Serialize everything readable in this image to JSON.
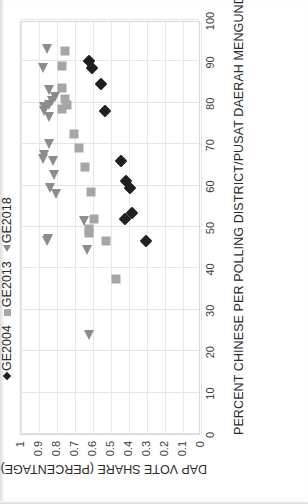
{
  "chart_data": {
    "type": "scatter",
    "title": "",
    "xlabel": "PERCENT CHINESE PER POLLING DISTRICT/PUSAT DAERAH MENGUNDI",
    "ylabel": "DAP VOTE SHARE (PERCENTAGE)",
    "xlim": [
      0,
      100
    ],
    "ylim": [
      0,
      1
    ],
    "xticks": [
      0,
      10,
      20,
      30,
      40,
      50,
      60,
      70,
      80,
      90,
      100
    ],
    "xtick_labels": [
      "0",
      "10",
      "20",
      "30",
      "40",
      "50",
      "60",
      "70",
      "80",
      "90",
      "100"
    ],
    "yticks": [
      0,
      0.1,
      0.2,
      0.3,
      0.4,
      0.5,
      0.6,
      0.7,
      0.8,
      0.9,
      1
    ],
    "ytick_labels": [
      "0",
      "0.1",
      "0.2",
      "0.3",
      "0.4",
      "0.5",
      "0.6",
      "0.7",
      "0.8",
      "0.9",
      "1"
    ],
    "grid": true,
    "legend_position": "top-left",
    "rotation_degrees": -90,
    "series": [
      {
        "name": "GE2004",
        "marker": "diamond",
        "color": "#1f1f1f",
        "points": [
          [
            90.0,
            0.625
          ],
          [
            88.5,
            0.605
          ],
          [
            84.5,
            0.555
          ],
          [
            78.0,
            0.535
          ],
          [
            66.0,
            0.445
          ],
          [
            61.0,
            0.415
          ],
          [
            59.5,
            0.395
          ],
          [
            53.5,
            0.385
          ],
          [
            52.0,
            0.425
          ],
          [
            46.5,
            0.305
          ]
        ]
      },
      {
        "name": "GE2013",
        "marker": "square",
        "color": "#a6a6a6",
        "points": [
          [
            92.5,
            0.755
          ],
          [
            89.0,
            0.775
          ],
          [
            83.5,
            0.775
          ],
          [
            81.0,
            0.755
          ],
          [
            79.5,
            0.745
          ],
          [
            78.5,
            0.775
          ],
          [
            72.5,
            0.705
          ],
          [
            69.0,
            0.68
          ],
          [
            64.5,
            0.645
          ],
          [
            58.5,
            0.61
          ],
          [
            52.0,
            0.595
          ],
          [
            49.5,
            0.62
          ],
          [
            48.5,
            0.625
          ],
          [
            46.5,
            0.53
          ],
          [
            37.5,
            0.475
          ]
        ]
      },
      {
        "name": "GE2018",
        "marker": "triangle",
        "color": "#8c8c8c",
        "points": [
          [
            93.0,
            0.855
          ],
          [
            88.5,
            0.88
          ],
          [
            83.0,
            0.845
          ],
          [
            81.5,
            0.81
          ],
          [
            80.5,
            0.83
          ],
          [
            79.5,
            0.845
          ],
          [
            79.0,
            0.87
          ],
          [
            78.0,
            0.87
          ],
          [
            76.5,
            0.845
          ],
          [
            70.0,
            0.845
          ],
          [
            67.5,
            0.875
          ],
          [
            66.5,
            0.88
          ],
          [
            66.0,
            0.82
          ],
          [
            62.5,
            0.815
          ],
          [
            59.5,
            0.84
          ],
          [
            58.0,
            0.805
          ],
          [
            51.5,
            0.65
          ],
          [
            47.0,
            0.85
          ],
          [
            46.5,
            0.855
          ],
          [
            44.5,
            0.635
          ],
          [
            24.0,
            0.62
          ]
        ]
      }
    ]
  },
  "legend": {
    "items": [
      {
        "label": "GE2004",
        "marker": "diamond"
      },
      {
        "label": "GE2013",
        "marker": "square"
      },
      {
        "label": "GE2018",
        "marker": "triangle"
      }
    ]
  }
}
